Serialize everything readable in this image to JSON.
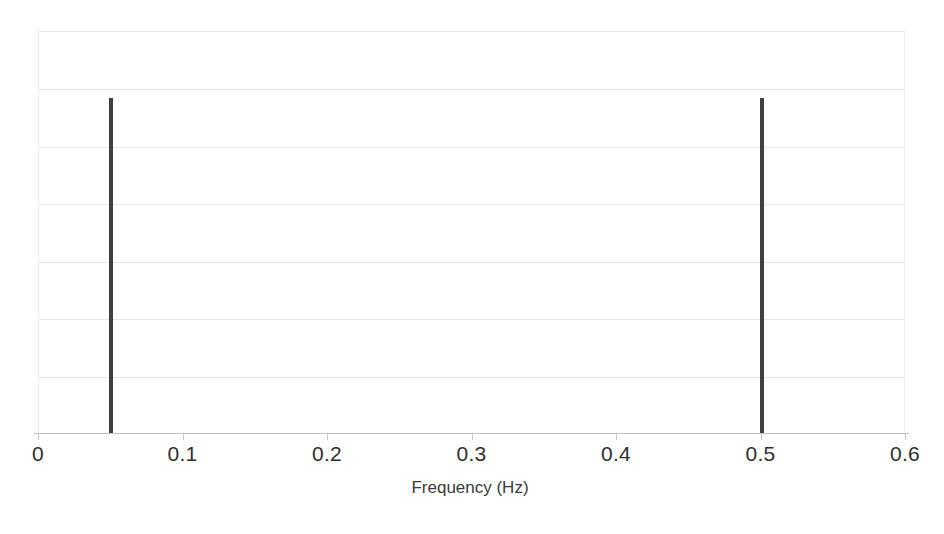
{
  "figure": {
    "background_color": "#ffffff",
    "plot": {
      "left": 38,
      "top": 31,
      "width": 867,
      "height": 402,
      "axis_line_color": "#bfbfc4",
      "grid_color": "#e6e6ea"
    }
  },
  "chart_data": {
    "type": "bar",
    "title": "",
    "subtitle": "",
    "xlabel": "Frequency (Hz)",
    "ylabel": "",
    "xlim": [
      0,
      0.6
    ],
    "ylim": [
      0,
      6
    ],
    "xticks": [
      0,
      0.1,
      0.2,
      0.3,
      0.4,
      0.5,
      0.6
    ],
    "xtick_labels": [
      "0",
      "0.1",
      "0.2",
      "0.3",
      "0.4",
      "0.5",
      "0.6"
    ],
    "yticks": [
      0,
      1,
      2,
      3,
      4,
      5,
      6
    ],
    "ytick_labels": [
      "",
      "",
      "",
      "",
      "",
      "",
      ""
    ],
    "grid": {
      "horizontal": true,
      "vertical": false,
      "count": 6,
      "color": "#e6e6ea"
    },
    "legend": null,
    "legend_position": "none",
    "annotations": [],
    "series": [
      {
        "name": "Spectrum",
        "color": "#404043",
        "bar_width_px": 4,
        "x": [
          0.05,
          0.5
        ],
        "values": [
          5,
          5
        ],
        "points": [
          {
            "x": 0.05,
            "y": 5,
            "label": "0.05 Hz"
          },
          {
            "x": 0.5,
            "y": 5,
            "label": "0.50 Hz"
          }
        ]
      }
    ]
  }
}
